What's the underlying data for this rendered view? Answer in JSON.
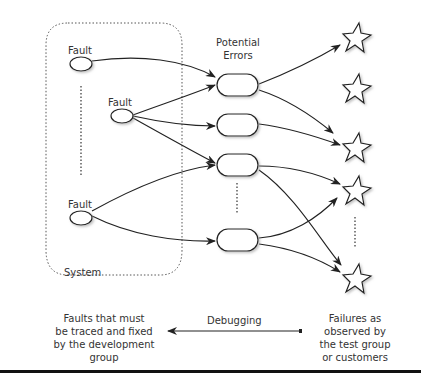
{
  "diagram": {
    "system_label": "System",
    "fault_labels": [
      "Fault",
      "Fault",
      "Fault"
    ],
    "potential_errors_label": [
      "Potential",
      "Errors"
    ],
    "debugging_label": "Debugging",
    "left_caption": [
      "Faults that must",
      "be traced and fixed",
      "by the development",
      "group"
    ],
    "right_caption": [
      "Failures as",
      "observed by",
      "the test group",
      "or customers"
    ],
    "nodes": {
      "faults": 3,
      "errors": 4,
      "failures": 5
    }
  }
}
